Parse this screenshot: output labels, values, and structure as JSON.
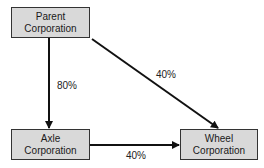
{
  "nodes": {
    "parent": {
      "line1": "Parent",
      "line2": "Corporation"
    },
    "axle": {
      "line1": "Axle",
      "line2": "Corporation"
    },
    "wheel": {
      "line1": "Wheel",
      "line2": "Corporation"
    }
  },
  "edges": {
    "parent_to_axle": {
      "label": "80%"
    },
    "parent_to_wheel": {
      "label": "40%"
    },
    "axle_to_wheel": {
      "label": "40%"
    }
  },
  "colors": {
    "box_fill": "#d9d9d9",
    "box_border": "#333333",
    "line": "#111111"
  }
}
